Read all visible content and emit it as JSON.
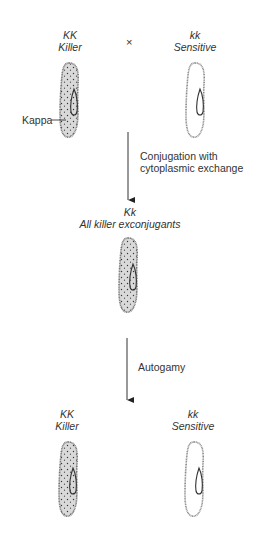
{
  "diagram": {
    "parents": {
      "left": {
        "genotype": "KK",
        "phenotype": "Killer",
        "has_kappa": true
      },
      "cross_symbol": "×",
      "right": {
        "genotype": "kk",
        "phenotype": "Sensitive",
        "has_kappa": false
      },
      "kappa_label": "Kappa"
    },
    "step1": {
      "label_line1": "Conjugation with",
      "label_line2": "cytoplasmic exchange"
    },
    "exconjugants": {
      "genotype": "Kk",
      "phenotype": "All killer exconjugants",
      "has_kappa": true
    },
    "step2": {
      "label": "Autogamy"
    },
    "progeny": {
      "left": {
        "genotype": "KK",
        "phenotype": "Killer",
        "has_kappa": true
      },
      "right": {
        "genotype": "kk",
        "phenotype": "Sensitive",
        "has_kappa": false
      }
    },
    "colors": {
      "killer_fill": "#d8d8d8",
      "outline": "#777777",
      "arrow": "#333333"
    }
  }
}
